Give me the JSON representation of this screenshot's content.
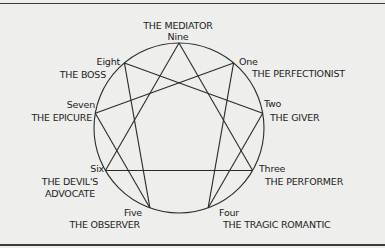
{
  "diagram": {
    "type": "enneagram",
    "points": [
      {
        "id": "nine",
        "number": "Nine",
        "title": "THE MEDIATOR"
      },
      {
        "id": "one",
        "number": "One",
        "title": "THE PERFECTIONIST"
      },
      {
        "id": "two",
        "number": "Two",
        "title": "THE GIVER"
      },
      {
        "id": "three",
        "number": "Three",
        "title": "THE PERFORMER"
      },
      {
        "id": "four",
        "number": "Four",
        "title": "THE TRAGIC ROMANTIC"
      },
      {
        "id": "five",
        "number": "Five",
        "title": "THE OBSERVER"
      },
      {
        "id": "six",
        "number": "Six",
        "title_line1": "THE DEVIL'S",
        "title_line2": "ADVOCATE"
      },
      {
        "id": "seven",
        "number": "Seven",
        "title": "THE EPICURE"
      },
      {
        "id": "eight",
        "number": "Eight",
        "title": "THE BOSS"
      }
    ],
    "connections": [
      [
        "nine",
        "three"
      ],
      [
        "three",
        "six"
      ],
      [
        "six",
        "nine"
      ],
      [
        "one",
        "four"
      ],
      [
        "four",
        "two"
      ],
      [
        "two",
        "eight"
      ],
      [
        "eight",
        "five"
      ],
      [
        "five",
        "seven"
      ],
      [
        "seven",
        "one"
      ]
    ],
    "line_color": "#2a2a2a"
  }
}
